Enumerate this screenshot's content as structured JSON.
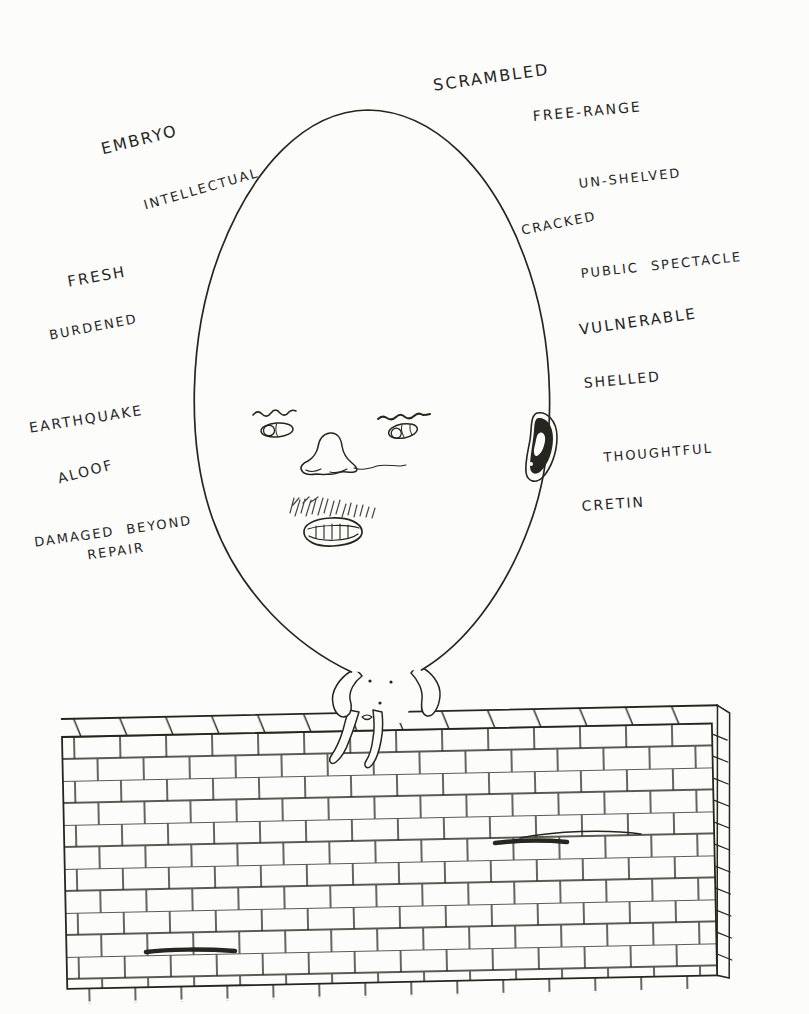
{
  "artwork": {
    "medium": "hand-drawn ink illustration",
    "scene": "egg man with a face sitting on a brick wall, surrounded by hand-written words"
  },
  "colors": {
    "ink": "#26261f",
    "paper": "#fcfcfb"
  },
  "labels": [
    {
      "id": "scrambled",
      "text": "SCRAMBLED"
    },
    {
      "id": "free-range",
      "text": "FREE-RANGE"
    },
    {
      "id": "embryo",
      "text": "EMBRYO"
    },
    {
      "id": "intellectual",
      "text": "INTELLECTUAL"
    },
    {
      "id": "un-shelved",
      "text": "UN-SHELVED"
    },
    {
      "id": "cracked",
      "text": "CRACKED"
    },
    {
      "id": "public-spectacle",
      "text": "PUBLIC SPECTACLE"
    },
    {
      "id": "fresh",
      "text": "FRESH"
    },
    {
      "id": "burdened",
      "text": "BURDENED"
    },
    {
      "id": "vulnerable",
      "text": "VULNERABLE"
    },
    {
      "id": "shelled",
      "text": "SHELLED"
    },
    {
      "id": "earthquake",
      "text": "EARTHQUAKE"
    },
    {
      "id": "thoughtful",
      "text": "THOUGHTFUL"
    },
    {
      "id": "aloof",
      "text": "ALOOF"
    },
    {
      "id": "cretin",
      "text": "CRETIN"
    },
    {
      "id": "damaged-beyond-repair",
      "text": "DAMAGED BEYOND\nREPAIR"
    }
  ]
}
